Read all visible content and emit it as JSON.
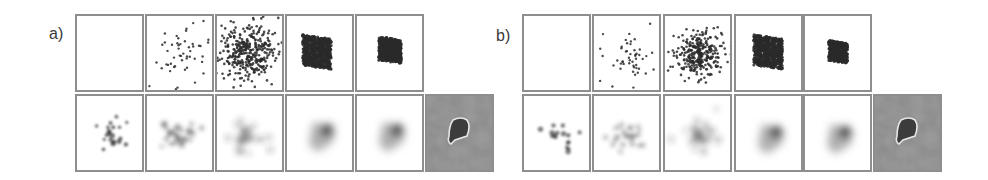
{
  "figure": {
    "groups": [
      {
        "label": "a)",
        "label_pos": [
          49,
          26
        ],
        "top_row": {
          "y": 14,
          "panels": [
            {
              "x": 75,
              "kind": "empty"
            },
            {
              "x": 145,
              "kind": "dots",
              "count": 55,
              "spread": 17,
              "cx": 34,
              "cy": 38,
              "r": 1.2,
              "seed": 3
            },
            {
              "x": 215,
              "kind": "dots",
              "count": 360,
              "spread": 14,
              "cx": 30,
              "cy": 36,
              "r": 1.3,
              "seed": 7
            },
            {
              "x": 285,
              "kind": "dots",
              "count": 650,
              "spread": 9,
              "cx": 30,
              "cy": 36,
              "r": 1.5,
              "seed": 11
            },
            {
              "x": 355,
              "kind": "dots",
              "count": 600,
              "spread": 7,
              "cx": 33,
              "cy": 34,
              "r": 1.5,
              "seed": 13
            }
          ]
        },
        "bottom_row": {
          "y": 94,
          "panels": [
            {
              "x": 75,
              "kind": "blobs",
              "count": 20,
              "spread": 10,
              "cx": 32,
              "cy": 40,
              "blur": 1.2,
              "opacity": 0.7,
              "seed": 21
            },
            {
              "x": 145,
              "kind": "blobs",
              "count": 30,
              "spread": 10,
              "cx": 32,
              "cy": 40,
              "blur": 2.2,
              "opacity": 0.55,
              "seed": 23
            },
            {
              "x": 215,
              "kind": "blobs",
              "count": 30,
              "spread": 9,
              "cx": 32,
              "cy": 40,
              "blur": 3.2,
              "opacity": 0.55,
              "seed": 25
            },
            {
              "x": 285,
              "kind": "glow",
              "cx": 34,
              "cy": 38,
              "core_dx": 6,
              "core_dy": -4
            },
            {
              "x": 355,
              "kind": "glow",
              "cx": 34,
              "cy": 38,
              "core_dx": 6,
              "core_dy": -4
            },
            {
              "x": 425,
              "kind": "segmentation"
            }
          ]
        }
      },
      {
        "label": "b)",
        "label_pos": [
          496,
          28
        ],
        "top_row": {
          "y": 14,
          "panels": [
            {
              "x": 522,
              "kind": "empty"
            },
            {
              "x": 592,
              "kind": "dots",
              "count": 50,
              "spread": 14,
              "cx": 36,
              "cy": 40,
              "r": 1.2,
              "seed": 31
            },
            {
              "x": 663,
              "kind": "dots",
              "count": 300,
              "spread": 12,
              "cx": 34,
              "cy": 38,
              "r": 1.3,
              "seed": 37
            },
            {
              "x": 734,
              "kind": "dots",
              "count": 620,
              "spread": 9,
              "cx": 32,
              "cy": 36,
              "r": 1.5,
              "seed": 41
            },
            {
              "x": 803,
              "kind": "dots",
              "count": 480,
              "spread": 6,
              "cx": 33,
              "cy": 36,
              "r": 1.4,
              "seed": 43
            }
          ]
        },
        "bottom_row": {
          "y": 94,
          "panels": [
            {
              "x": 522,
              "kind": "blobs",
              "count": 16,
              "spread": 10,
              "cx": 34,
              "cy": 40,
              "blur": 1.1,
              "opacity": 0.6,
              "seed": 51
            },
            {
              "x": 592,
              "kind": "blobs",
              "count": 26,
              "spread": 10,
              "cx": 34,
              "cy": 40,
              "blur": 2.0,
              "opacity": 0.45,
              "seed": 53
            },
            {
              "x": 663,
              "kind": "blobs",
              "count": 30,
              "spread": 10,
              "cx": 34,
              "cy": 40,
              "blur": 3.0,
              "opacity": 0.55,
              "seed": 57
            },
            {
              "x": 734,
              "kind": "glow",
              "cx": 34,
              "cy": 40,
              "core_dx": 6,
              "core_dy": -4
            },
            {
              "x": 803,
              "kind": "glow",
              "cx": 34,
              "cy": 40,
              "core_dx": 6,
              "core_dy": -4
            },
            {
              "x": 873,
              "kind": "segmentation"
            }
          ]
        }
      }
    ],
    "colors": {
      "border": "#8e8e8e",
      "dot": "#2a2a2a",
      "label": "#3a3a3a",
      "gray_bg": "#8a8a8a",
      "seg_blob": "#3c3c3c",
      "seg_outline": "#e6e6e6"
    }
  }
}
